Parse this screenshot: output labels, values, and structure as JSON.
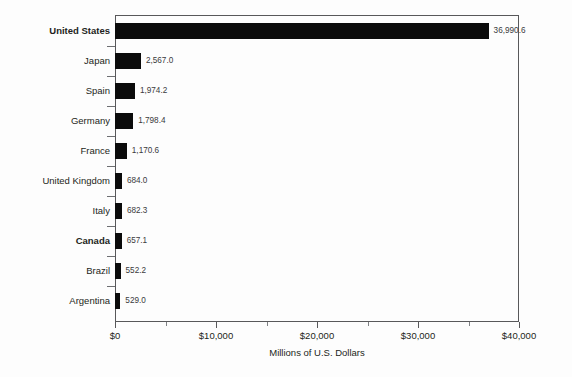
{
  "chart_data": {
    "type": "bar",
    "orientation": "horizontal",
    "title": "",
    "subtitle": "",
    "xlabel": "Millions of U.S. Dollars",
    "ylabel": "",
    "xlim": [
      0,
      40000
    ],
    "grid": false,
    "legend": null,
    "categories": [
      "United States",
      "Japan",
      "Spain",
      "Germany",
      "France",
      "United Kingdom",
      "Italy",
      "Canada",
      "Brazil",
      "Argentina"
    ],
    "values": [
      36990.6,
      2567.0,
      1974.2,
      1798.4,
      1170.6,
      684.0,
      682.3,
      657.1,
      552.2,
      529.0
    ],
    "value_labels": [
      "36,990.6",
      "2,567.0",
      "1,974.2",
      "1,798.4",
      "1,170.6",
      "684.0",
      "682.3",
      "657.1",
      "552.2",
      "529.0"
    ],
    "emphasized_categories": [
      "United States",
      "Canada"
    ],
    "xticks": [
      0,
      10000,
      20000,
      30000,
      40000
    ],
    "xtick_labels": [
      "$0",
      "$10,000",
      "$20,000",
      "$30,000",
      "$40,000"
    ],
    "xticks_minor": [
      5000,
      15000,
      25000,
      35000
    ],
    "bar_color": "#0b0b0b",
    "axis_color": "#58585a",
    "label_color": "#231f20",
    "value_label_color": "#3a3a3c",
    "background_color": "#fdfdfd"
  }
}
